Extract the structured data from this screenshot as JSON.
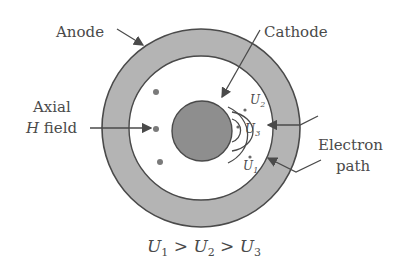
{
  "diagram": {
    "labels": {
      "anode": "Anode",
      "cathode": "Cathode",
      "axial_line1": "Axial",
      "axial_line2_italic": "H",
      "axial_line2_rest": " field",
      "electron_line1": "Electron",
      "electron_line2": "path"
    },
    "path_labels": {
      "u1": "U",
      "u1_sub": "1",
      "u2": "U",
      "u2_sub": "2",
      "u3": "U",
      "u3_sub": "3"
    },
    "equation": {
      "a": "U",
      "a_sub": "1",
      "gt1": " > ",
      "b": "U",
      "b_sub": "2",
      "gt2": " > ",
      "c": "U",
      "c_sub": "3"
    },
    "colors": {
      "anode_fill": "#b4b4b4",
      "cathode_fill": "#8e8e8e",
      "stroke": "#4a4a4a",
      "text": "#4a4a4a"
    }
  }
}
